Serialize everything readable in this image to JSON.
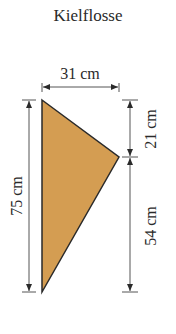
{
  "title": "Kielflosse",
  "dimensions": {
    "top_width": "31 cm",
    "total_height": "75 cm",
    "upper_right": "21 cm",
    "lower_right": "54 cm"
  },
  "colors": {
    "fill": "#D49D52",
    "stroke": "#2a2a2a"
  }
}
